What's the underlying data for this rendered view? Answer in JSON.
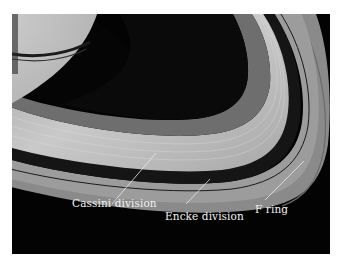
{
  "figure": {
    "labels": {
      "cassini": "Cassini division",
      "encke": "Encke division",
      "fring": "F ring"
    },
    "colors": {
      "background": "#030303",
      "label_text": "#f2f2f2",
      "page": "#ffffff"
    }
  }
}
